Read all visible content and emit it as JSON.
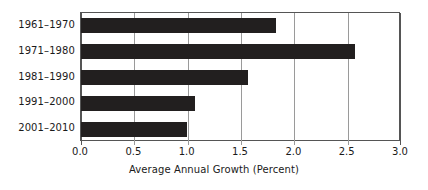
{
  "chart_data": {
    "type": "bar",
    "orientation": "horizontal",
    "title": "",
    "xlabel": "Average Annual Growth (Percent)",
    "ylabel": "",
    "categories": [
      "1961–1970",
      "1971–1980",
      "1981–1990",
      "1991–2000",
      "2001–2010"
    ],
    "values": [
      1.83,
      2.57,
      1.57,
      1.07,
      0.99
    ],
    "xlim": [
      0.0,
      3.0
    ],
    "xticks": [
      0.0,
      0.5,
      1.0,
      1.5,
      2.0,
      2.5,
      3.0
    ],
    "xtick_labels": [
      "0.0",
      "0.5",
      "1.0",
      "1.5",
      "2.0",
      "2.5",
      "3.0"
    ],
    "grid": "vertical",
    "legend": "none",
    "bar_color": "#221f1f",
    "grid_color": "#9a9a9a",
    "axis_color": "#555555",
    "background_color": "#ffffff"
  }
}
